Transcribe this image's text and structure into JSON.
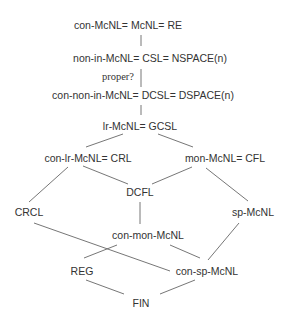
{
  "diagram": {
    "type": "hierarchy",
    "nodes": {
      "re": "con-McNL= McNL= RE",
      "csl": "non-in-McNL= CSL= NSPACE(n)",
      "proper": "proper?",
      "dcsl": "con-non-in-McNL= DCSL= DSPACE(n)",
      "gcsl": "lr-McNL= GCSL",
      "crl": "con-lr-McNL= CRL",
      "cfl": "mon-McNL= CFL",
      "dcfl": "DCFL",
      "crcl": "CRCL",
      "sp": "sp-McNL",
      "conmon": "con-mon-McNL",
      "reg": "REG",
      "consp": "con-sp-McNL",
      "fin": "FIN"
    },
    "edges": [
      [
        "re",
        "csl"
      ],
      [
        "csl",
        "dcsl"
      ],
      [
        "dcsl",
        "gcsl"
      ],
      [
        "gcsl",
        "crl"
      ],
      [
        "gcsl",
        "cfl"
      ],
      [
        "crl",
        "crcl"
      ],
      [
        "crl",
        "dcfl"
      ],
      [
        "cfl",
        "dcfl"
      ],
      [
        "cfl",
        "sp"
      ],
      [
        "dcfl",
        "conmon"
      ],
      [
        "crcl",
        "consp"
      ],
      [
        "conmon",
        "reg"
      ],
      [
        "conmon",
        "consp"
      ],
      [
        "sp",
        "consp"
      ],
      [
        "reg",
        "fin"
      ],
      [
        "consp",
        "fin"
      ]
    ]
  }
}
